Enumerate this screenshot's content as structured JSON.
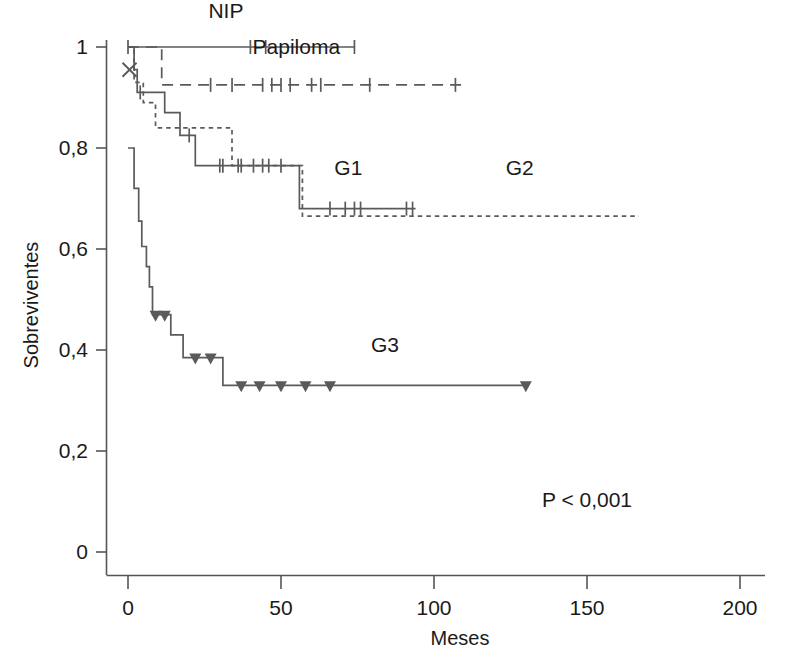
{
  "chart_data": {
    "type": "line",
    "subtype": "kaplan-meier-survival",
    "title": "",
    "xlabel": "Meses",
    "ylabel": "Sobreviventes",
    "xlim": [
      0,
      212
    ],
    "ylim": [
      0,
      1.04
    ],
    "xticks": [
      0,
      50,
      100,
      150,
      200
    ],
    "xticklabels": [
      "0",
      "50",
      "100",
      "150",
      "200"
    ],
    "yticks": [
      0,
      0.2,
      0.4,
      0.6,
      0.8,
      1
    ],
    "yticklabels": [
      "0",
      "0,2",
      "0,4",
      "0,6",
      "0,8",
      "1"
    ],
    "grid": false,
    "legend_position": "inline-annotations",
    "annotations": [
      {
        "text": "P < 0,001",
        "x": 150,
        "y": 0.09
      }
    ],
    "series": [
      {
        "name": "NIP",
        "label": "NIP",
        "linestyle": "solid",
        "color": "#5a5a5a",
        "label_x": 32,
        "label_y": 1.045,
        "censor_marker": "tick",
        "steps": [
          {
            "t": 0,
            "s": 1.0
          },
          {
            "t": 74,
            "s": 1.0
          }
        ],
        "censored_times": [
          0,
          40,
          45,
          74
        ]
      },
      {
        "name": "Papiloma",
        "label": "Papiloma",
        "linestyle": "long-dash",
        "color": "#5a5a5a",
        "label_x": 55,
        "label_y": 0.975,
        "censor_marker": "tick",
        "steps": [
          {
            "t": 0,
            "s": 1.0
          },
          {
            "t": 11,
            "s": 1.0
          },
          {
            "t": 11,
            "s": 0.925
          },
          {
            "t": 110,
            "s": 0.925
          }
        ],
        "censored_times": [
          27,
          34,
          44,
          47,
          50,
          53,
          60,
          63,
          79,
          107
        ],
        "x_marker": {
          "t": 0.5,
          "s": 0.955
        }
      },
      {
        "name": "G1",
        "label": "G1",
        "linestyle": "solid",
        "color": "#5a5a5a",
        "label_x": 72,
        "label_y": 0.735,
        "censor_marker": "tick",
        "steps": [
          {
            "t": 0,
            "s": 1.0
          },
          {
            "t": 2,
            "s": 1.0
          },
          {
            "t": 2,
            "s": 0.955
          },
          {
            "t": 3,
            "s": 0.955
          },
          {
            "t": 3,
            "s": 0.91
          },
          {
            "t": 12,
            "s": 0.91
          },
          {
            "t": 12,
            "s": 0.87
          },
          {
            "t": 17,
            "s": 0.87
          },
          {
            "t": 17,
            "s": 0.825
          },
          {
            "t": 22,
            "s": 0.825
          },
          {
            "t": 22,
            "s": 0.765
          },
          {
            "t": 56,
            "s": 0.765
          },
          {
            "t": 56,
            "s": 0.68
          },
          {
            "t": 94,
            "s": 0.68
          }
        ],
        "censored_times": [
          4,
          20,
          30,
          31,
          36,
          37,
          41,
          44,
          46,
          50,
          66,
          71,
          74,
          76,
          91,
          93
        ]
      },
      {
        "name": "G2",
        "label": "G2",
        "linestyle": "short-dash",
        "color": "#5a5a5a",
        "label_x": 128,
        "label_y": 0.735,
        "censor_marker": "none",
        "steps": [
          {
            "t": 0,
            "s": 1.0
          },
          {
            "t": 2,
            "s": 1.0
          },
          {
            "t": 2,
            "s": 0.93
          },
          {
            "t": 5,
            "s": 0.93
          },
          {
            "t": 5,
            "s": 0.89
          },
          {
            "t": 9,
            "s": 0.89
          },
          {
            "t": 9,
            "s": 0.84
          },
          {
            "t": 34,
            "s": 0.84
          },
          {
            "t": 34,
            "s": 0.765
          },
          {
            "t": 57,
            "s": 0.765
          },
          {
            "t": 57,
            "s": 0.665
          },
          {
            "t": 167,
            "s": 0.665
          }
        ],
        "censored_times": []
      },
      {
        "name": "G3",
        "label": "G3",
        "linestyle": "solid",
        "color": "#5a5a5a",
        "label_x": 84,
        "label_y": 0.385,
        "censor_marker": "triangle",
        "steps": [
          {
            "t": 0,
            "s": 0.8
          },
          {
            "t": 2,
            "s": 0.8
          },
          {
            "t": 2,
            "s": 0.72
          },
          {
            "t": 3.5,
            "s": 0.72
          },
          {
            "t": 3.5,
            "s": 0.655
          },
          {
            "t": 4.5,
            "s": 0.655
          },
          {
            "t": 4.5,
            "s": 0.605
          },
          {
            "t": 6,
            "s": 0.605
          },
          {
            "t": 6,
            "s": 0.565
          },
          {
            "t": 7,
            "s": 0.565
          },
          {
            "t": 7,
            "s": 0.525
          },
          {
            "t": 8,
            "s": 0.525
          },
          {
            "t": 8,
            "s": 0.47
          },
          {
            "t": 14,
            "s": 0.47
          },
          {
            "t": 14,
            "s": 0.43
          },
          {
            "t": 18,
            "s": 0.43
          },
          {
            "t": 18,
            "s": 0.385
          },
          {
            "t": 31,
            "s": 0.385
          },
          {
            "t": 31,
            "s": 0.33
          },
          {
            "t": 130,
            "s": 0.33
          }
        ],
        "censored_times": [
          9,
          12,
          22,
          27,
          37,
          43,
          50,
          58,
          66,
          130
        ]
      }
    ]
  },
  "axes": {
    "x_title": "Meses",
    "y_title": "Sobreviventes"
  },
  "stats": {
    "p_value_text": "P < 0,001"
  },
  "labels": {
    "nip": "NIP",
    "papiloma": "Papiloma",
    "g1": "G1",
    "g2": "G2",
    "g3": "G3"
  },
  "colors": {
    "curve": "#5a5a5a",
    "axis": "#555555",
    "text": "#1a1a1a",
    "background": "#ffffff"
  }
}
